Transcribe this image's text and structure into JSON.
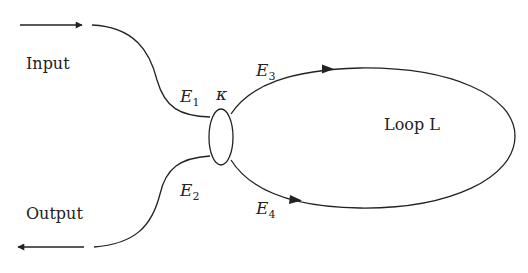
{
  "diagram": {
    "type": "fiber-loop-resonator",
    "labels": {
      "input": "Input",
      "output": "Output",
      "loop": "Loop L",
      "coupling": "κ"
    },
    "fields": [
      {
        "symbol": "E",
        "sub": "1"
      },
      {
        "symbol": "E",
        "sub": "2"
      },
      {
        "symbol": "E",
        "sub": "3"
      },
      {
        "symbol": "E",
        "sub": "4"
      }
    ],
    "colors": {
      "stroke": "#222222",
      "background": "#ffffff"
    }
  }
}
